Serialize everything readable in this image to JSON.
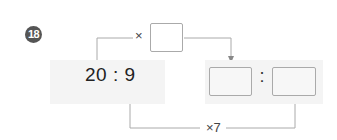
{
  "problem": {
    "number": "18",
    "left_ratio": {
      "text": "20 : 9",
      "first": "20",
      "second": "9"
    },
    "top_operation": {
      "symbol": "×",
      "blank": ""
    },
    "bottom_operation": {
      "label": "×7"
    },
    "result_ratio": {
      "first_blank": "",
      "separator": ":",
      "second_blank": ""
    }
  },
  "colors": {
    "badge": "#555555",
    "panel": "#f4f4f4",
    "line": "#999999",
    "box_border": "#aaaaaa",
    "text": "#222222"
  }
}
